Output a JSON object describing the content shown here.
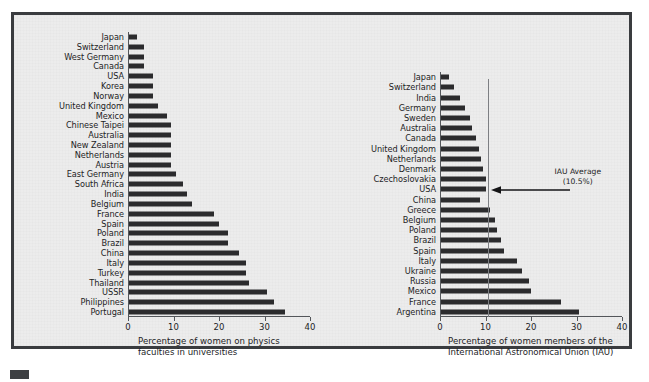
{
  "figure": {
    "background_color": "#ececec",
    "frame_color": "#3a3c3f",
    "bar_color": "#2b2b2d",
    "axis_color": "#53565a",
    "reference_line_color": "#7d7f83"
  },
  "chart_data": [
    {
      "type": "bar",
      "orientation": "horizontal",
      "title": "",
      "xlabel": "Percentage of women on physics\nfaculties in universities",
      "ylabel": "",
      "xlim": [
        0,
        40
      ],
      "xticks": [
        0,
        10,
        20,
        30,
        40
      ],
      "xtick_labels": [
        "0",
        "10",
        "20",
        "30",
        "40"
      ],
      "grid": false,
      "legend": "none",
      "categories": [
        "Japan",
        "Switzerland",
        "West Germany",
        "Canada",
        "USA",
        "Korea",
        "Norway",
        "United Kingdom",
        "Mexico",
        "Chinese Taipei",
        "Australia",
        "New Zealand",
        "Netherlands",
        "Austria",
        "East Germany",
        "South Africa",
        "India",
        "Belgium",
        "France",
        "Spain",
        "Poland",
        "Brazil",
        "China",
        "Italy",
        "Turkey",
        "Thailand",
        "USSR",
        "Philippines",
        "Portugal"
      ],
      "values": [
        2.0,
        3.5,
        3.5,
        3.5,
        5.5,
        5.5,
        5.5,
        6.5,
        8.5,
        9.5,
        9.5,
        9.5,
        9.5,
        9.5,
        10.5,
        12.0,
        13.0,
        14.0,
        19.0,
        20.0,
        22.0,
        22.0,
        24.5,
        26.0,
        26.0,
        26.5,
        30.5,
        32.0,
        34.5
      ]
    },
    {
      "type": "bar",
      "orientation": "horizontal",
      "title": "",
      "xlabel": "Percentage of women members of the\nInternational Astronomical Union (IAU)",
      "ylabel": "",
      "xlim": [
        0,
        40
      ],
      "xticks": [
        0,
        10,
        20,
        30,
        40
      ],
      "xtick_labels": [
        "0",
        "10",
        "20",
        "30",
        "40"
      ],
      "grid": false,
      "legend": "none",
      "categories": [
        "Japan",
        "Switzerland",
        "India",
        "Germany",
        "Sweden",
        "Australia",
        "Canada",
        "United Kingdom",
        "Netherlands",
        "Denmark",
        "Czechoslovakia",
        "USA",
        "China",
        "Greece",
        "Belgium",
        "Poland",
        "Brazil",
        "Spain",
        "Italy",
        "Ukraine",
        "Russia",
        "Mexico",
        "France",
        "Argentina"
      ],
      "values": [
        2.0,
        3.0,
        4.5,
        5.5,
        6.5,
        7.0,
        8.0,
        8.5,
        9.0,
        9.5,
        10.0,
        10.0,
        8.8,
        11.0,
        12.0,
        12.5,
        13.5,
        14.0,
        17.0,
        18.0,
        19.5,
        20.0,
        26.5,
        30.5
      ],
      "annotations": [
        {
          "name": "iau-average",
          "type": "vertical-line-with-label",
          "value": 10.5,
          "label": "IAU Average\n(10.5%)"
        }
      ]
    }
  ]
}
